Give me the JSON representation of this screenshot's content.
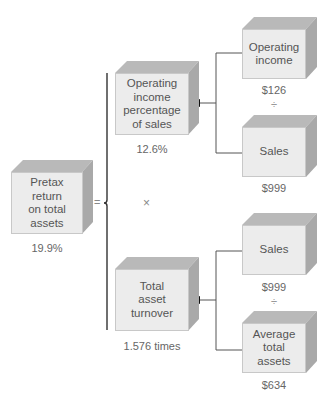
{
  "diagram": {
    "title": "",
    "result": {
      "label": "Pretax return on total assets",
      "lines": [
        "Pretax",
        "return",
        "on total",
        "assets"
      ],
      "value": "19.9%"
    },
    "equals_symbol": "=",
    "multiply_symbol": "×",
    "factor_1": {
      "label": "Operating income percentage of sales",
      "lines": [
        "Operating",
        "income",
        "percentage",
        "of sales"
      ],
      "value": "12.6%",
      "numerator": {
        "lines": [
          "Operating",
          "income"
        ],
        "value": "$126"
      },
      "divide_symbol": "÷",
      "denominator": {
        "lines": [
          "Sales"
        ],
        "value": "$999"
      }
    },
    "factor_2": {
      "label": "Total asset turnover",
      "lines": [
        "Total",
        "asset",
        "turnover"
      ],
      "value": "1.576 times",
      "numerator": {
        "lines": [
          "Sales"
        ],
        "value": "$999"
      },
      "divide_symbol": "÷",
      "denominator": {
        "lines": [
          "Average",
          "total",
          "assets"
        ],
        "value": "$634"
      }
    },
    "colors": {
      "box_front": "#ececec",
      "box_top": "#b9b9b9",
      "box_side": "#a9a9a9",
      "line": "#555555",
      "text": "#555555"
    }
  }
}
